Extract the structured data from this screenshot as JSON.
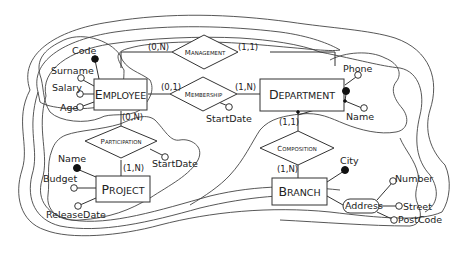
{
  "diagram": {
    "type": "entity-relationship schema",
    "entities": [
      {
        "id": "employee",
        "first": "E",
        "rest": "MPLOYEE",
        "name": "Employee"
      },
      {
        "id": "department",
        "first": "D",
        "rest": "EPARTMENT",
        "name": "Department"
      },
      {
        "id": "project",
        "first": "P",
        "rest": "ROJECT",
        "name": "Project"
      },
      {
        "id": "branch",
        "first": "B",
        "rest": "RANCH",
        "name": "Branch"
      }
    ],
    "relationships": [
      {
        "id": "management",
        "first": "M",
        "rest": "ANAGEMENT",
        "name": "Management"
      },
      {
        "id": "membership",
        "first": "M",
        "rest": "EMBERSHIP",
        "name": "Membership"
      },
      {
        "id": "participation",
        "first": "P",
        "rest": "ARTICIPATION",
        "name": "Participation"
      },
      {
        "id": "composition",
        "first": "C",
        "rest": "OMPOSITION",
        "name": "Composition"
      }
    ],
    "attributes": {
      "employee": {
        "code": "Code",
        "surname": "Surname",
        "salary": "Salary",
        "age": "Age"
      },
      "department": {
        "phone": "Phone",
        "name": "Name"
      },
      "project": {
        "name": "Name",
        "budget": "Budget",
        "release_date": "ReleaseDate"
      },
      "branch": {
        "city": "City",
        "address": "Address"
      },
      "address": {
        "number": "Number",
        "street": "Street",
        "post_code": "PostCode"
      },
      "membership": {
        "start_date": "StartDate"
      },
      "participation": {
        "start_date": "StartDate"
      }
    },
    "cardinalities": {
      "management_employee": "(0,N)",
      "management_department": "(1,1)",
      "membership_employee": "(0,1)",
      "membership_department": "(1,N)",
      "participation_employee": "(0,N)",
      "participation_project": "(1,N)",
      "composition_department": "(1,1)",
      "composition_branch": "(1,N)"
    },
    "identifiers": {
      "employee": [
        "Code"
      ],
      "project": [
        "Name"
      ],
      "department": [
        "Name",
        "Branch (external)"
      ],
      "branch": [
        "City"
      ]
    }
  }
}
